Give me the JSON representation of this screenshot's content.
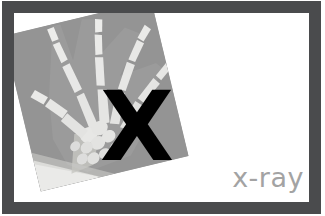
{
  "card": {
    "type": "alphabet-flashcard",
    "letter": "X",
    "word": "x-ray",
    "frame_color": "#4a4b4d",
    "face_color": "#ffffff",
    "letter_color": "#000000",
    "word_color": "#a3a3a3"
  },
  "photo": {
    "name": "hand-xray-photograph",
    "alt": "x-ray radiograph of a human hand showing bones",
    "background_color": "#9b9b9b",
    "bone_color": "#f2f2f0",
    "rotation_degrees": -13.5
  }
}
